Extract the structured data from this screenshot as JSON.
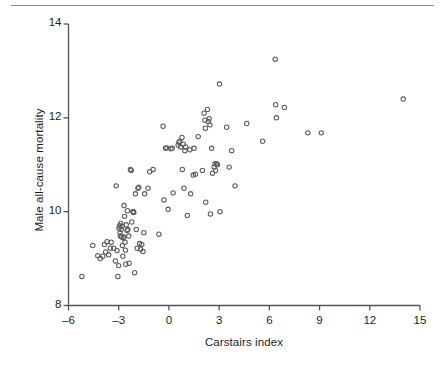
{
  "figure": {
    "background_color": "#ffffff",
    "rule_color": "#8d8d8d",
    "axis_color": "#555555",
    "marker_color": "#5b5b5b",
    "text_color": "#1d1d1d"
  },
  "axis_titles": {
    "x": "Carstairs index",
    "y": "Male all-cause mortality"
  },
  "ticks": {
    "x_labels": [
      "–6",
      "–3",
      "0",
      "3",
      "6",
      "9",
      "12",
      "15"
    ],
    "y_labels": [
      "8",
      "10",
      "12",
      "14"
    ]
  },
  "chart_data": {
    "type": "scatter",
    "title": "",
    "xlabel": "Carstairs index",
    "ylabel": "Male all-cause mortality",
    "xlim": [
      -6,
      15
    ],
    "ylim": [
      8,
      14
    ],
    "xticks": [
      -6,
      -3,
      0,
      3,
      6,
      9,
      12,
      15
    ],
    "yticks": [
      8,
      10,
      12,
      14
    ],
    "grid": false,
    "legend": null,
    "marker": "open-circle",
    "marker_size_px": 4.4,
    "series": [
      {
        "name": "Local areas",
        "n_points": 121,
        "points": [
          [
            -5.2,
            8.62
          ],
          [
            -4.55,
            9.28
          ],
          [
            -4.25,
            9.06
          ],
          [
            -4.1,
            9.0
          ],
          [
            -3.95,
            9.05
          ],
          [
            -3.85,
            9.3
          ],
          [
            -3.78,
            9.14
          ],
          [
            -3.7,
            9.36
          ],
          [
            -3.6,
            9.08
          ],
          [
            -3.5,
            9.22
          ],
          [
            -3.45,
            9.35
          ],
          [
            -3.3,
            9.22
          ],
          [
            -3.2,
            8.95
          ],
          [
            -3.15,
            10.55
          ],
          [
            -3.1,
            9.17
          ],
          [
            -3.05,
            8.62
          ],
          [
            -3.0,
            8.85
          ],
          [
            -2.98,
            9.65
          ],
          [
            -2.95,
            9.7
          ],
          [
            -2.92,
            9.55
          ],
          [
            -2.9,
            9.48
          ],
          [
            -2.88,
            9.75
          ],
          [
            -2.85,
            9.62
          ],
          [
            -2.82,
            9.46
          ],
          [
            -2.8,
            9.69
          ],
          [
            -2.78,
            9.28
          ],
          [
            -2.75,
            9.05
          ],
          [
            -2.72,
            9.44
          ],
          [
            -2.7,
            9.46
          ],
          [
            -2.68,
            10.13
          ],
          [
            -2.65,
            9.9
          ],
          [
            -2.62,
            9.35
          ],
          [
            -2.6,
            9.18
          ],
          [
            -2.58,
            8.88
          ],
          [
            -2.55,
            9.72
          ],
          [
            -2.5,
            9.6
          ],
          [
            -2.48,
            10.02
          ],
          [
            -2.45,
            9.62
          ],
          [
            -2.4,
            9.48
          ],
          [
            -2.38,
            8.9
          ],
          [
            -2.3,
            10.9
          ],
          [
            -2.25,
            10.88
          ],
          [
            -2.22,
            9.78
          ],
          [
            -2.15,
            10.0
          ],
          [
            -2.12,
            10.0
          ],
          [
            -2.1,
            9.98
          ],
          [
            -2.05,
            8.7
          ],
          [
            -2.0,
            10.38
          ],
          [
            -1.95,
            9.62
          ],
          [
            -1.9,
            9.22
          ],
          [
            -1.85,
            10.5
          ],
          [
            -1.8,
            10.52
          ],
          [
            -1.75,
            9.32
          ],
          [
            -1.7,
            9.2
          ],
          [
            -1.62,
            9.3
          ],
          [
            -1.55,
            9.15
          ],
          [
            -1.5,
            9.55
          ],
          [
            -1.45,
            10.38
          ],
          [
            -1.25,
            10.5
          ],
          [
            -1.15,
            10.85
          ],
          [
            -0.95,
            10.9
          ],
          [
            -0.6,
            9.52
          ],
          [
            -0.35,
            11.82
          ],
          [
            -0.3,
            10.25
          ],
          [
            -0.2,
            11.35
          ],
          [
            -0.12,
            11.36
          ],
          [
            -0.05,
            10.05
          ],
          [
            0.12,
            11.34
          ],
          [
            0.2,
            11.35
          ],
          [
            0.25,
            10.4
          ],
          [
            0.55,
            11.42
          ],
          [
            0.6,
            11.48
          ],
          [
            0.65,
            11.5
          ],
          [
            0.7,
            11.38
          ],
          [
            0.78,
            11.58
          ],
          [
            0.8,
            10.9
          ],
          [
            0.85,
            11.44
          ],
          [
            0.9,
            10.5
          ],
          [
            0.95,
            11.3
          ],
          [
            1.0,
            11.38
          ],
          [
            1.1,
            9.92
          ],
          [
            1.25,
            11.32
          ],
          [
            1.3,
            10.38
          ],
          [
            1.45,
            10.78
          ],
          [
            1.5,
            11.35
          ],
          [
            1.58,
            10.8
          ],
          [
            1.75,
            11.6
          ],
          [
            2.0,
            10.88
          ],
          [
            2.1,
            12.1
          ],
          [
            2.15,
            11.95
          ],
          [
            2.18,
            11.78
          ],
          [
            2.2,
            10.2
          ],
          [
            2.3,
            12.18
          ],
          [
            2.35,
            11.92
          ],
          [
            2.4,
            11.98
          ],
          [
            2.45,
            11.85
          ],
          [
            2.48,
            9.95
          ],
          [
            2.55,
            11.35
          ],
          [
            2.6,
            10.82
          ],
          [
            2.7,
            10.95
          ],
          [
            2.75,
            11.02
          ],
          [
            2.78,
            10.88
          ],
          [
            2.85,
            11.02
          ],
          [
            2.9,
            11.0
          ],
          [
            3.02,
            12.72
          ],
          [
            3.05,
            10.0
          ],
          [
            3.45,
            11.8
          ],
          [
            3.6,
            10.95
          ],
          [
            3.75,
            11.3
          ],
          [
            3.95,
            10.55
          ],
          [
            4.65,
            11.88
          ],
          [
            5.6,
            11.5
          ],
          [
            6.35,
            13.25
          ],
          [
            6.38,
            12.28
          ],
          [
            6.42,
            12.0
          ],
          [
            6.9,
            12.22
          ],
          [
            8.3,
            11.68
          ],
          [
            9.1,
            11.68
          ],
          [
            14.0,
            12.4
          ]
        ]
      }
    ]
  }
}
